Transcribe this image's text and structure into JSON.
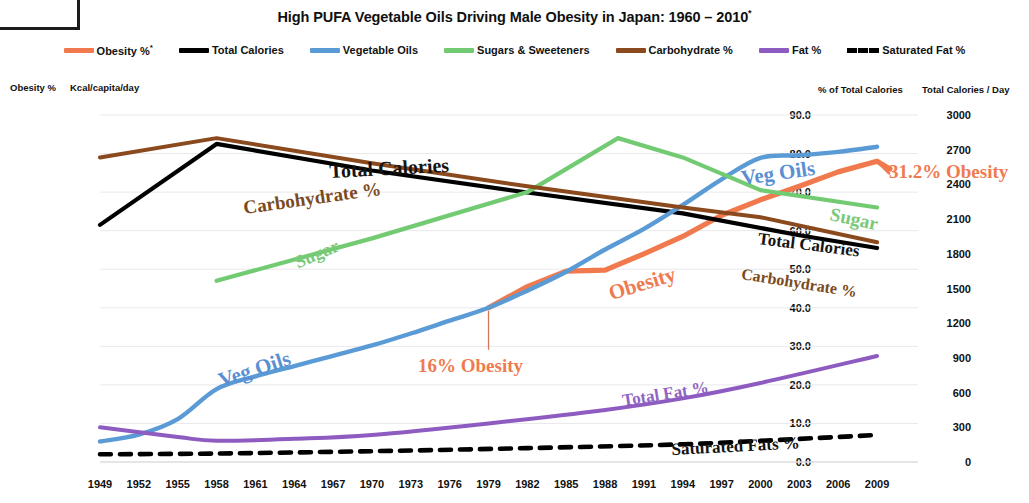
{
  "header": {
    "title": "High PUFA Vegetable Oils Driving Male Obesity in Japan: 1960 – 2010",
    "title_superscript": "*"
  },
  "legend": {
    "position": "top",
    "items": [
      {
        "label": "Obesity %",
        "superscript": "*",
        "color": "#f07a4e",
        "style": "solid"
      },
      {
        "label": "Total Calories",
        "superscript": "",
        "color": "#000000",
        "style": "solid"
      },
      {
        "label": "Vegetable Oils",
        "superscript": "",
        "color": "#5b9bd5",
        "style": "solid"
      },
      {
        "label": "Sugars & Sweeteners",
        "superscript": "",
        "color": "#72cb72",
        "style": "solid"
      },
      {
        "label": "Carbohydrate %",
        "superscript": "",
        "color": "#8a4a1e",
        "style": "solid"
      },
      {
        "label": "Fat %",
        "superscript": "",
        "color": "#8e5cc0",
        "style": "solid"
      },
      {
        "label": "Saturated Fat %",
        "superscript": "",
        "color": "#000000",
        "style": "dashed"
      }
    ]
  },
  "axes": {
    "left_outer": {
      "caption": "Obesity %",
      "ticks": [
        "36",
        "32",
        "28",
        "24",
        "20",
        "16",
        "12",
        "8",
        "4",
        "0"
      ],
      "min": 0,
      "max": 36,
      "step": 4
    },
    "left_inner": {
      "caption": "Kcal/capita/day",
      "ticks": [
        "405",
        "360",
        "315",
        "270",
        "225",
        "180",
        "135",
        "90",
        "45",
        "0"
      ],
      "min": 0,
      "max": 405,
      "step": 45
    },
    "right_inner": {
      "caption": "% of Total Calories",
      "ticks": [
        "90.0",
        "80.0",
        "70.0",
        "60.0",
        "50.0",
        "40.0",
        "30.0",
        "20.0",
        "10.0",
        "0.0"
      ],
      "min": 0,
      "max": 90,
      "step": 10
    },
    "right_outer": {
      "caption": "Total Calories / Day",
      "ticks": [
        "3000",
        "2700",
        "2400",
        "2100",
        "1800",
        "1500",
        "1200",
        "900",
        "600",
        "300",
        "0"
      ],
      "min": 0,
      "max": 3000,
      "step": 300
    },
    "x": {
      "caption": "",
      "ticks": [
        "1949",
        "1952",
        "1955",
        "1958",
        "1961",
        "1964",
        "1967",
        "1970",
        "1973",
        "1976",
        "1979",
        "1982",
        "1985",
        "1988",
        "1991",
        "1994",
        "1997",
        "2000",
        "2003",
        "2006",
        "2009"
      ]
    }
  },
  "annotations": [
    {
      "name": "total-calories-label",
      "text": "Total Calories",
      "x": 330,
      "y": 160,
      "class": "ann-tc"
    },
    {
      "name": "carbohydrate-label",
      "text": "Carbohydrate %",
      "x": 245,
      "y": 197,
      "class": "ann-carb"
    },
    {
      "name": "sugar-label-left",
      "text": "Sugar",
      "x": 300,
      "y": 252,
      "class": "ann-sugar-left"
    },
    {
      "name": "veg-oils-label-left",
      "text": "Veg Oils",
      "x": 223,
      "y": 368,
      "class": "ann-veg-left"
    },
    {
      "name": "obesity-label",
      "text": "Obesity",
      "x": 613,
      "y": 281,
      "class": "ann-obesity"
    },
    {
      "name": "veg-oils-label-right",
      "text": "Veg Oils",
      "x": 743,
      "y": 166,
      "class": "ann-veg-right"
    },
    {
      "name": "sugar-label-right",
      "text": "Sugar",
      "x": 828,
      "y": 203,
      "class": "ann-sugar-right"
    },
    {
      "name": "total-calories-label-2",
      "text": "Total Calories",
      "x": 757,
      "y": 229,
      "class": "ann-tc2"
    },
    {
      "name": "carbohydrate-label-2",
      "text": "Carbohydrate %",
      "x": 740,
      "y": 265,
      "class": "ann-carb2"
    },
    {
      "name": "total-fat-label",
      "text": "Total Fat %",
      "x": 624,
      "y": 391,
      "class": "ann-fat"
    },
    {
      "name": "saturated-fats-label",
      "text": "Saturated Fats %",
      "x": 672,
      "y": 440,
      "class": "ann-satfat"
    },
    {
      "name": "obesity-16-callout",
      "text": "16% Obesity",
      "x": 418,
      "y": 355,
      "class": "ann-16"
    },
    {
      "name": "obesity-312-callout",
      "text": "31.2% Obesity",
      "x": 889,
      "y": 161,
      "class": "ann-312"
    }
  ],
  "chart_data": {
    "type": "line",
    "xlabel": "",
    "ylabel": "Obesity % / Kcal/capita/day",
    "y2label": "% of Total Calories / Total Calories per Day",
    "grid": true,
    "legend_position": "top",
    "x": [
      1949,
      1952,
      1955,
      1958,
      1961,
      1964,
      1967,
      1970,
      1973,
      1976,
      1979,
      1982,
      1985,
      1988,
      1991,
      1994,
      1997,
      2000,
      2003,
      2006,
      2009
    ],
    "xlim": [
      1949,
      2010
    ],
    "series": [
      {
        "name": "Obesity %",
        "color": "#f07a4e",
        "style": "solid",
        "axis": "left_outer",
        "unit": "%",
        "x": [
          1979,
          1982,
          1985,
          1988,
          1991,
          1994,
          1997,
          2000,
          2003,
          2006,
          2009,
          2010
        ],
        "values": [
          16.0,
          18.2,
          19.8,
          19.9,
          21.6,
          23.4,
          25.6,
          27.2,
          28.6,
          30.1,
          31.2,
          30.4
        ]
      },
      {
        "name": "Total Calories",
        "color": "#000000",
        "style": "solid",
        "axis": "right_outer",
        "unit": "kcal/day",
        "x": [
          1949,
          1958,
          1970,
          1982,
          1994,
          2003,
          2009
        ],
        "values": [
          2050,
          2750,
          2520,
          2330,
          2150,
          1960,
          1850
        ]
      },
      {
        "name": "Vegetable Oils",
        "color": "#5b9bd5",
        "style": "solid",
        "axis": "left_inner",
        "unit": "kcal/capita/day",
        "x": [
          1949,
          1952,
          1955,
          1958,
          1961,
          1964,
          1967,
          1970,
          1973,
          1976,
          1979,
          1982,
          1985,
          1988,
          1991,
          1994,
          1997,
          2000,
          2003,
          2006,
          2009
        ],
        "values": [
          24,
          32,
          50,
          85,
          100,
          112,
          124,
          136,
          150,
          165,
          180,
          200,
          222,
          248,
          272,
          300,
          330,
          355,
          358,
          362,
          368
        ]
      },
      {
        "name": "Sugars & Sweeteners",
        "color": "#72cb72",
        "style": "solid",
        "axis": "right_inner",
        "unit": "% of total calories",
        "x": [
          1958,
          1970,
          1982,
          1989,
          1994,
          2000,
          2009
        ],
        "values": [
          47.0,
          58.0,
          70.0,
          84.0,
          79.0,
          70.5,
          66.0
        ]
      },
      {
        "name": "Carbohydrate %",
        "color": "#8a4a1e",
        "style": "solid",
        "axis": "right_inner",
        "unit": "% of total calories",
        "x": [
          1949,
          1958,
          1970,
          1982,
          1994,
          2000,
          2009
        ],
        "values": [
          79.0,
          84.0,
          77.5,
          71.5,
          66.0,
          63.5,
          57.0
        ]
      },
      {
        "name": "Fat %",
        "color": "#8e5cc0",
        "style": "solid",
        "axis": "right_inner",
        "unit": "% of total calories",
        "x": [
          1949,
          1955,
          1958,
          1964,
          1970,
          1979,
          1988,
          1994,
          2000,
          2009
        ],
        "values": [
          9.0,
          6.5,
          5.5,
          6.0,
          7.0,
          10.0,
          13.5,
          16.5,
          20.5,
          27.5
        ]
      },
      {
        "name": "Saturated Fat %",
        "color": "#000000",
        "style": "dashed",
        "axis": "right_inner",
        "unit": "% of total calories",
        "x": [
          1949,
          1958,
          1970,
          1982,
          1994,
          2003,
          2009
        ],
        "values": [
          2.0,
          2.2,
          2.8,
          3.6,
          4.6,
          6.0,
          7.0
        ]
      }
    ]
  }
}
